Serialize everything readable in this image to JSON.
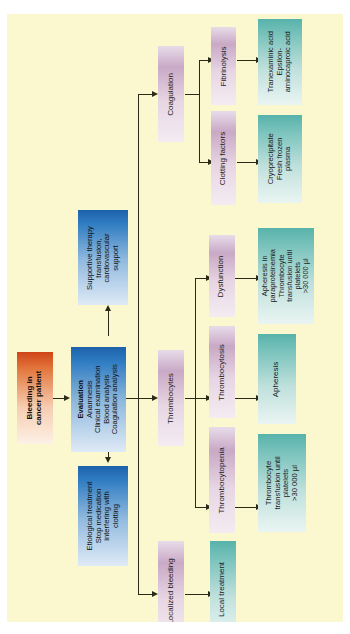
{
  "figure": {
    "background_color": "#fbf8cf",
    "orientation": "rotated-90",
    "type": "flowchart"
  },
  "nodes": {
    "start": {
      "label": "Bleeding in\ncancer patient",
      "color": "#cf4417",
      "group": "start"
    },
    "evaluation": {
      "title": "Evaluation",
      "lines": "Anamnesis\nClinical examination\nBlood analysis\nCoagulation analysis",
      "color": "#1d62ab",
      "group": "assessment"
    },
    "supportive": {
      "label": "Supportive therapy\ntransfusion,\ncardiovascular\nsupport",
      "color": "#1d62ab",
      "group": "therapy"
    },
    "etiological": {
      "label": "Etiological treatment\nStop medication\ninterfering with\nclotting",
      "color": "#1d62ab",
      "group": "therapy"
    },
    "coagulation": {
      "label": "Coagulation",
      "color": "#c9a9c6",
      "group": "branch"
    },
    "fibrinolysis": {
      "label": "Fibrinolysis",
      "color": "#c9a9c6",
      "group": "branch"
    },
    "clotting_factors": {
      "label": "Clotting factors",
      "color": "#c9a9c6",
      "group": "branch"
    },
    "antifibrinolytics": {
      "label": "Tranexaminic acid\nEpsilon-\naminocaproic acid",
      "color": "#57b3ab",
      "group": "treatment"
    },
    "cryo": {
      "label": "Cryoprecipitate\nFresh frozen\nplasma",
      "color": "#57b3ab",
      "group": "treatment"
    },
    "thrombocytes": {
      "label": "Thrombocytes",
      "color": "#c9a9c6",
      "group": "branch"
    },
    "dysfunction": {
      "label": "Dysfunction",
      "color": "#c9a9c6",
      "group": "branch"
    },
    "thrombocytosis": {
      "label": "Thrombocytosis",
      "color": "#c9a9c6",
      "group": "branch"
    },
    "thrombocytopenia": {
      "label": "Thrombocytopenia",
      "color": "#c9a9c6",
      "group": "branch"
    },
    "dysfunction_tx": {
      "label": "Apheresis in\nparaproteinemia\nThrombocyte\ntransfusion until\nplatelets\n>30 000 µl",
      "color": "#57b3ab",
      "group": "treatment"
    },
    "thrombocytosis_tx": {
      "label": "Apheresis",
      "color": "#57b3ab",
      "group": "treatment"
    },
    "thrombocytopenia_tx": {
      "label": "Thrombocyte\ntransfusion until\nplatelets\n>30 000 µl",
      "color": "#57b3ab",
      "group": "treatment"
    },
    "localized_bleeding": {
      "label": "Localized bleeding",
      "color": "#c9a9c6",
      "group": "branch"
    },
    "local_treatment": {
      "label": "Local treatment",
      "color": "#57b3ab",
      "group": "treatment"
    }
  },
  "edges": [
    {
      "from": "start",
      "to": "evaluation"
    },
    {
      "from": "evaluation",
      "to": "supportive"
    },
    {
      "from": "evaluation",
      "to": "etiological"
    },
    {
      "from": "evaluation",
      "to": "coagulation"
    },
    {
      "from": "evaluation",
      "to": "thrombocytes"
    },
    {
      "from": "evaluation",
      "to": "localized_bleeding"
    },
    {
      "from": "coagulation",
      "to": "fibrinolysis"
    },
    {
      "from": "coagulation",
      "to": "clotting_factors"
    },
    {
      "from": "fibrinolysis",
      "to": "antifibrinolytics"
    },
    {
      "from": "clotting_factors",
      "to": "cryo"
    },
    {
      "from": "thrombocytes",
      "to": "dysfunction"
    },
    {
      "from": "thrombocytes",
      "to": "thrombocytosis"
    },
    {
      "from": "thrombocytes",
      "to": "thrombocytopenia"
    },
    {
      "from": "dysfunction",
      "to": "dysfunction_tx"
    },
    {
      "from": "thrombocytosis",
      "to": "thrombocytosis_tx"
    },
    {
      "from": "thrombocytopenia",
      "to": "thrombocytopenia_tx"
    },
    {
      "from": "localized_bleeding",
      "to": "local_treatment"
    }
  ]
}
